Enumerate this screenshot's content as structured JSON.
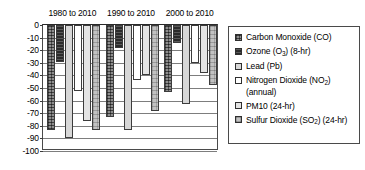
{
  "chart_data": {
    "type": "bar",
    "title": "",
    "xlabel": "",
    "ylabel": "",
    "ylim": [
      -100,
      0
    ],
    "ytick_step": 10,
    "grid": true,
    "orientation": "vertical-negative",
    "legend_position": "right",
    "categories": [
      "1980 to 2010",
      "1990 to 2010",
      "2000 to 2010"
    ],
    "ytick_labels": [
      "0",
      "-10",
      "-20",
      "-30",
      "-40",
      "-50",
      "-60",
      "-70",
      "-80",
      "-90",
      "-100"
    ],
    "ytick_values": [
      0,
      -10,
      -20,
      -30,
      -40,
      -50,
      -60,
      -70,
      -80,
      -90,
      -100
    ],
    "series": [
      {
        "name": "Carbon Monoxide (CO)",
        "swatch": "crosshatch-gray",
        "color": "#8e8e8e",
        "values": [
          -83,
          -73,
          -53
        ]
      },
      {
        "name": "Ozone (O3)  (8-hr)",
        "name_parts": [
          "Ozone (O",
          "3",
          ")  (8-hr)"
        ],
        "swatch": "solid-dark",
        "color": "#2b2b2b",
        "values": [
          -29,
          -18,
          -14
        ]
      },
      {
        "name": "Lead (Pb)",
        "swatch": "light-gray",
        "color": "#d7d7d7",
        "values": [
          -90,
          -83,
          -63
        ]
      },
      {
        "name": "Nitrogen Dioxide (NO2) (annual)",
        "name_parts": [
          "Nitrogen Dioxide (NO",
          "2",
          ") (annual)"
        ],
        "swatch": "white",
        "color": "#ffffff",
        "values": [
          -52,
          -44,
          -30
        ]
      },
      {
        "name": "PM10 (24-hr)",
        "swatch": "pale-gray",
        "color": "#e4e4e4",
        "values": [
          -76,
          -40,
          -38
        ]
      },
      {
        "name": "Sulfur Dioxide (SO2) (24-hr)",
        "name_parts": [
          "Sulfur Dioxide (SO",
          "2",
          ") (24-hr)"
        ],
        "swatch": "fine-crosshatch-gray",
        "color": "#c2c2c2",
        "values": [
          -83,
          -68,
          -48
        ]
      }
    ]
  },
  "legend": {
    "items": [
      {
        "label_pre": "Carbon Monoxide (CO)",
        "label_sub": "",
        "label_post": ""
      },
      {
        "label_pre": "Ozone (O",
        "label_sub": "3",
        "label_post": ")  (8-hr)"
      },
      {
        "label_pre": "Lead (Pb)",
        "label_sub": "",
        "label_post": ""
      },
      {
        "label_pre": "Nitrogen Dioxide (NO",
        "label_sub": "2",
        "label_post": ") (annual)"
      },
      {
        "label_pre": "PM10 (24-hr)",
        "label_sub": "",
        "label_post": ""
      },
      {
        "label_pre": "Sulfur Dioxide (SO",
        "label_sub": "2",
        "label_post": ") (24-hr)"
      }
    ]
  }
}
